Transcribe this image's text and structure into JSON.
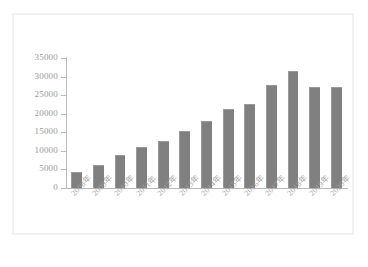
{
  "chart_data": {
    "type": "bar",
    "title": "",
    "xlabel": "",
    "ylabel": "",
    "grid": false,
    "legend": "none",
    "ylim": [
      0,
      35000
    ],
    "yticks": [
      0,
      5000,
      10000,
      15000,
      20000,
      25000,
      30000,
      35000
    ],
    "ytick_labels": [
      "0",
      "5000",
      "10000",
      "15000",
      "20000",
      "25000",
      "30000",
      "35000"
    ],
    "categories": [
      "2008年",
      "2009年",
      "2010年",
      "2011年",
      "2012年",
      "2013年",
      "2014年",
      "2015年",
      "2016年",
      "2017年",
      "2018年",
      "2019年",
      "2020年"
    ],
    "values": [
      4300,
      6200,
      9000,
      11000,
      12600,
      15400,
      18000,
      21200,
      22600,
      27700,
      31600,
      27200,
      27300
    ],
    "bar_color": "#808080",
    "axis_color": "#b9b9b9",
    "tick_label_color": "#9a9a9a"
  },
  "figure": {
    "background": "#ffffff",
    "frame_color": "#f1f1f1",
    "caption": ""
  }
}
